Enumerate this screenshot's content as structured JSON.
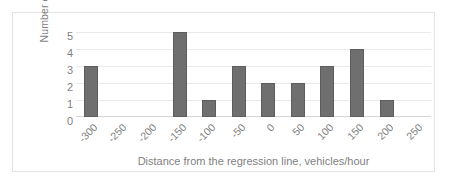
{
  "chart_data": {
    "type": "bar",
    "title": "",
    "subtitle": "",
    "xlabel": "Distance from the regression line, vehicles/hour",
    "ylabel": "Number of cases",
    "categories": [
      "-300",
      "-250",
      "-200",
      "-150",
      "-100",
      "-50",
      "0",
      "50",
      "100",
      "150",
      "200",
      "250"
    ],
    "values": [
      3,
      0,
      0,
      5,
      1,
      3,
      2,
      2,
      3,
      4,
      1,
      0
    ],
    "xlim": [
      -300,
      250
    ],
    "ylim": [
      0,
      5
    ],
    "y_ticks": [
      "5",
      "4",
      "3",
      "2",
      "1",
      "0"
    ],
    "y_tick_values": [
      5,
      4,
      3,
      2,
      1,
      0
    ],
    "grid": "horizontal",
    "legend": "none",
    "bar_color": "#6f6f6f",
    "bar_edge_color": "#5d5d5d",
    "gridline_color": "#e9e9e9",
    "text_color": "#7f7f7f",
    "frame_color": "#e3e3e3",
    "background_color": "#ffffff",
    "x_tick_rotation": -45
  }
}
